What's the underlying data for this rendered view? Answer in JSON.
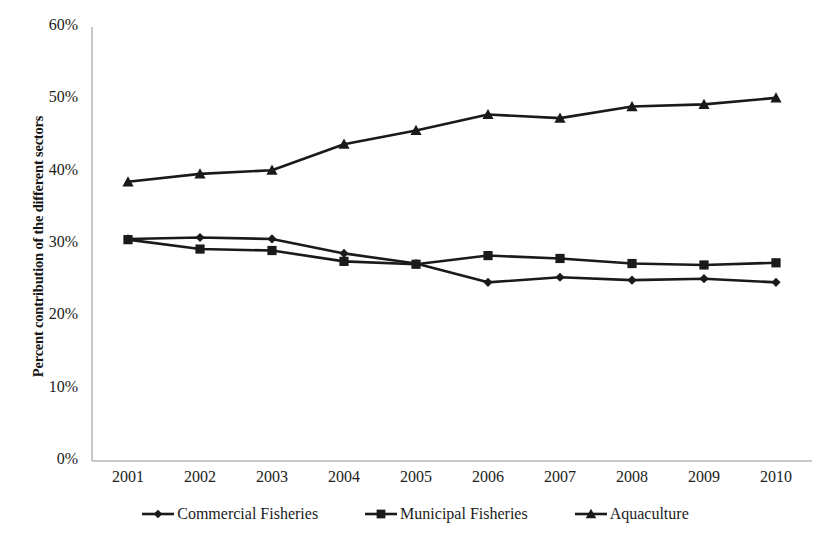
{
  "chart_data": {
    "type": "line",
    "title": "",
    "xlabel": "",
    "ylabel": "Percent contribution of the different sectors",
    "categories": [
      "2001",
      "2002",
      "2003",
      "2004",
      "2005",
      "2006",
      "2007",
      "2008",
      "2009",
      "2010"
    ],
    "x": [
      2001,
      2002,
      2003,
      2004,
      2005,
      2006,
      2007,
      2008,
      2009,
      2010
    ],
    "ylim": [
      0,
      60
    ],
    "ytick_values": [
      0,
      10,
      20,
      30,
      40,
      50,
      60
    ],
    "ytick_labels": [
      "0%",
      "10%",
      "20%",
      "30%",
      "40%",
      "50%",
      "60%"
    ],
    "grid": false,
    "legend_position": "bottom",
    "line_color": "#1a1a1a",
    "series": [
      {
        "name": "Commercial Fisheries",
        "marker": "diamond",
        "color": "#1a1a1a",
        "values": [
          30.7,
          30.9,
          30.7,
          28.7,
          27.3,
          24.7,
          25.4,
          25.0,
          25.2,
          24.7
        ]
      },
      {
        "name": "Municipal Fisheries",
        "marker": "square",
        "color": "#1a1a1a",
        "values": [
          30.6,
          29.3,
          29.1,
          27.6,
          27.2,
          28.4,
          28.0,
          27.3,
          27.1,
          27.4
        ]
      },
      {
        "name": "Aquaculture",
        "marker": "triangle",
        "color": "#1a1a1a",
        "values": [
          38.6,
          39.7,
          40.2,
          43.8,
          45.7,
          47.9,
          47.4,
          49.0,
          49.3,
          50.2
        ]
      }
    ]
  }
}
